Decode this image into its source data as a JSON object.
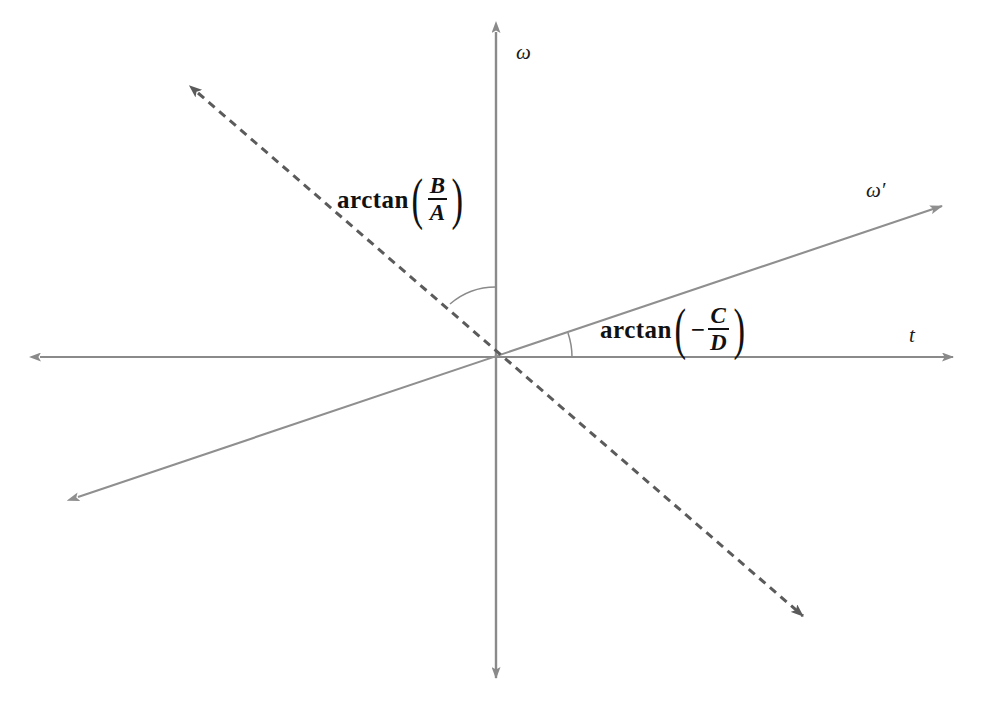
{
  "figure": {
    "type": "math-diagram",
    "background_color": "#ffffff",
    "width": 994,
    "height": 708
  },
  "axes": {
    "horizontal": {
      "label": "t",
      "name": "t-axis",
      "color": "#8a8a8a",
      "arrowheads": "both",
      "x_start": 38,
      "x_end": 955,
      "y": 357,
      "label_x": 909,
      "label_y": 327
    },
    "vertical": {
      "label": "ω",
      "name": "omega-axis",
      "color": "#8a8a8a",
      "arrowheads": "both",
      "y_start": 30,
      "y_end": 680,
      "x": 496,
      "label_x": 516,
      "label_y": 42
    }
  },
  "origin": {
    "x": 496,
    "y": 357
  },
  "lines": [
    {
      "name": "omega-prime-line",
      "label": "ω′",
      "style": "solid",
      "color": "#8f8f8f",
      "arrowheads": "both",
      "x1": 75,
      "y1": 498,
      "x2": 945,
      "y2": 205,
      "label_x": 866,
      "label_y": 182,
      "angle_from_t_axis_deg": 18.6
    },
    {
      "name": "dashed-line",
      "style": "dashed",
      "color": "#5b5b5b",
      "dash_pattern": "8,6",
      "arrowheads": "both",
      "x1": 195,
      "y1": 90,
      "x2": 806,
      "y2": 619,
      "angle_from_omega_axis_deg": 49.1
    }
  ],
  "angle_arcs": [
    {
      "name": "arc-arctan-b-over-a",
      "color": "#8a8a8a",
      "radius": 70,
      "from_deg": 131,
      "to_deg": 90,
      "between": [
        "dashed-line",
        "omega-axis"
      ]
    },
    {
      "name": "arc-arctan-minus-c-over-d",
      "color": "#8a8a8a",
      "radius": 76,
      "from_deg": 0,
      "to_deg": 18.6,
      "between": [
        "t-axis",
        "omega-prime-line"
      ]
    }
  ],
  "labels": {
    "arctan_b_a": {
      "function": "arctan",
      "numerator": "B",
      "denominator": "A",
      "sign": "",
      "x": 337,
      "y": 176
    },
    "arctan_minus_c_d": {
      "function": "arctan",
      "numerator": "C",
      "denominator": "D",
      "sign": "−",
      "x": 600,
      "y": 306
    }
  }
}
